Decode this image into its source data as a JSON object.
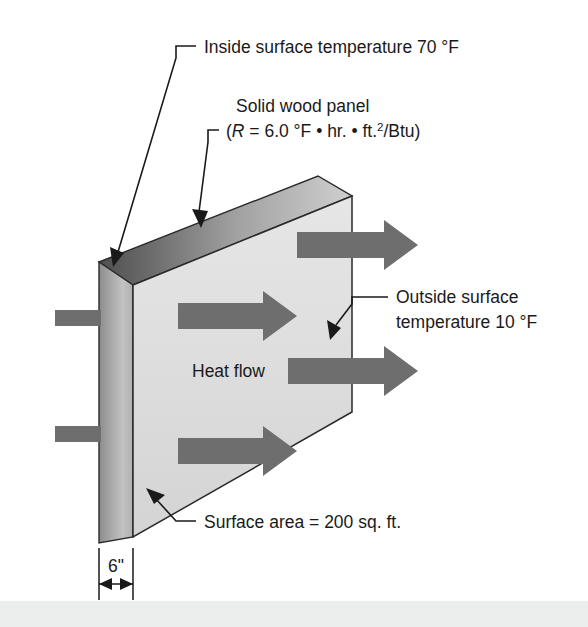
{
  "figure": {
    "background_color": "#ffffff",
    "arrow_color": "#6e6e6e",
    "line_color": "#1a1a1a",
    "panel_face_light": "#e2e2e2",
    "panel_face_dark": "#9a9a9a"
  },
  "labels": {
    "inside_surface": "Inside surface temperature 70 °F",
    "panel_name": "Solid wood panel",
    "r_value_open": "(",
    "r_value_symbol": "R",
    "r_value_eq": " = 6.0 °F • hr. • ft.",
    "r_value_exp": "2",
    "r_value_tail": "/Btu)",
    "outside_surface_line1": "Outside surface",
    "outside_surface_line2": "temperature 10 °F",
    "heat_flow": "Heat flow",
    "surface_area": "Surface area = 200 sq. ft.",
    "thickness": "6\""
  },
  "values": {
    "inside_temperature_f": 70,
    "outside_temperature_f": 10,
    "r_value": 6.0,
    "r_value_units": "°F • hr. • ft.2/Btu",
    "surface_area_sqft": 200,
    "thickness_inches": 6,
    "heat_arrow_count": 5
  }
}
